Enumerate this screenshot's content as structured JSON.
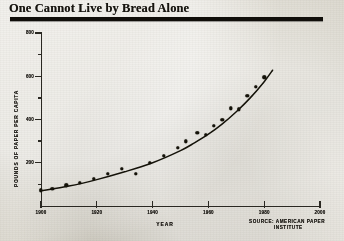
{
  "title": "One Cannot Live by Bread Alone",
  "source": {
    "line1": "SOURCE:  AMERICAN PAPER",
    "line2": "INSTITUTE"
  },
  "colors": {
    "ink": "#141209",
    "paper": "#dbd8ce",
    "axis": "#2a2822"
  },
  "chart_data": {
    "type": "scatter",
    "title": "One Cannot Live by Bread Alone",
    "xlabel": "YEAR",
    "ylabel": "POUNDS OF PAPER PER CAPITA",
    "xlim": [
      1900,
      2000
    ],
    "ylim": [
      0,
      800
    ],
    "grid": false,
    "legend": null,
    "x_ticks": [
      1900,
      1920,
      1940,
      1960,
      1980,
      2000
    ],
    "y_ticks": [
      200,
      400,
      600,
      800
    ],
    "y_minor_ticks": [
      100,
      300,
      500,
      700
    ],
    "annotation": "SOURCE: AMERICAN PAPER INSTITUTE",
    "series": [
      {
        "name": "Paper consumption per capita",
        "marker": "filled-circle",
        "points": [
          {
            "x": 1900,
            "y": 72
          },
          {
            "x": 1904,
            "y": 80
          },
          {
            "x": 1909,
            "y": 96
          },
          {
            "x": 1914,
            "y": 108
          },
          {
            "x": 1919,
            "y": 125
          },
          {
            "x": 1924,
            "y": 150
          },
          {
            "x": 1929,
            "y": 172
          },
          {
            "x": 1934,
            "y": 148
          },
          {
            "x": 1939,
            "y": 200
          },
          {
            "x": 1944,
            "y": 232
          },
          {
            "x": 1949,
            "y": 268
          },
          {
            "x": 1952,
            "y": 300
          },
          {
            "x": 1956,
            "y": 338
          },
          {
            "x": 1959,
            "y": 330
          },
          {
            "x": 1962,
            "y": 370
          },
          {
            "x": 1965,
            "y": 400
          },
          {
            "x": 1968,
            "y": 452
          },
          {
            "x": 1971,
            "y": 448
          },
          {
            "x": 1974,
            "y": 510
          },
          {
            "x": 1977,
            "y": 552
          },
          {
            "x": 1980,
            "y": 596
          }
        ]
      },
      {
        "name": "Fitted trend curve",
        "marker": "line",
        "curve": [
          {
            "x": 1900,
            "y": 70
          },
          {
            "x": 1910,
            "y": 92
          },
          {
            "x": 1920,
            "y": 122
          },
          {
            "x": 1930,
            "y": 158
          },
          {
            "x": 1940,
            "y": 200
          },
          {
            "x": 1950,
            "y": 256
          },
          {
            "x": 1955,
            "y": 292
          },
          {
            "x": 1960,
            "y": 332
          },
          {
            "x": 1965,
            "y": 380
          },
          {
            "x": 1970,
            "y": 436
          },
          {
            "x": 1975,
            "y": 500
          },
          {
            "x": 1980,
            "y": 575
          },
          {
            "x": 1983,
            "y": 628
          }
        ]
      }
    ]
  }
}
